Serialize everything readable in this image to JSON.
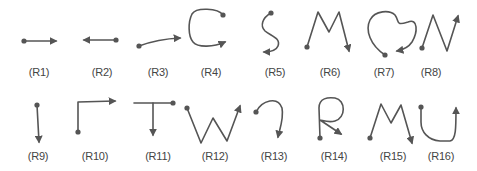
{
  "figure": {
    "stroke_color": "#555555",
    "background": "#ffffff",
    "rows": [
      {
        "items": [
          {
            "id": "R1",
            "label": "(R1)",
            "shape": "straight-line-right"
          },
          {
            "id": "R2",
            "label": "(R2)",
            "shape": "straight-line-left"
          },
          {
            "id": "R3",
            "label": "(R3)",
            "shape": "rising-line-right"
          },
          {
            "id": "R4",
            "label": "(R4)",
            "shape": "c-curve"
          },
          {
            "id": "R5",
            "label": "(R5)",
            "shape": "s-curve"
          },
          {
            "id": "R6",
            "label": "(R6)",
            "shape": "m-zigzag"
          },
          {
            "id": "R7",
            "label": "(R7)",
            "shape": "heart-loop"
          },
          {
            "id": "R8",
            "label": "(R8)",
            "shape": "n-zigzag"
          }
        ]
      },
      {
        "items": [
          {
            "id": "R9",
            "label": "(R9)",
            "shape": "vertical-line-down"
          },
          {
            "id": "R10",
            "label": "(R10)",
            "shape": "l-turn-right"
          },
          {
            "id": "R11",
            "label": "(R11)",
            "shape": "t-shape"
          },
          {
            "id": "R12",
            "label": "(R12)",
            "shape": "w-zigzag"
          },
          {
            "id": "R13",
            "label": "(R13)",
            "shape": "hook-curve"
          },
          {
            "id": "R14",
            "label": "(R14)",
            "shape": "r-shape"
          },
          {
            "id": "R15",
            "label": "(R15)",
            "shape": "m-zigzag"
          },
          {
            "id": "R16",
            "label": "(R16)",
            "shape": "u-curve"
          }
        ]
      }
    ]
  }
}
